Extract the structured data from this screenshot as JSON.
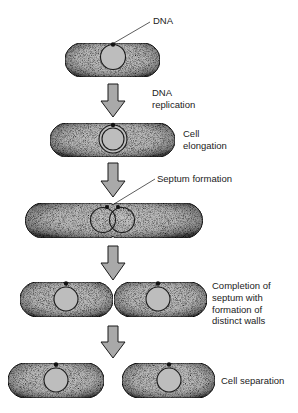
{
  "diagram": {
    "labels": {
      "dna": "DNA",
      "dna_replication_1": "DNA",
      "dna_replication_2": "replication",
      "cell_elongation_1": "Cell",
      "cell_elongation_2": "elongation",
      "septum_formation": "Septum formation",
      "completion_1": "Completion of",
      "completion_2": "septum with",
      "completion_3": "formation of",
      "completion_4": "distinct walls",
      "cell_separation": "Cell separation"
    },
    "stages": [
      {
        "name": "initial-cell",
        "caption": "DNA"
      },
      {
        "name": "dna-replication",
        "caption": "DNA replication"
      },
      {
        "name": "cell-elongation",
        "caption": "Cell elongation"
      },
      {
        "name": "septum-formation",
        "caption": "Septum formation"
      },
      {
        "name": "completion-of-septum",
        "caption": "Completion of septum with formation of distinct walls"
      },
      {
        "name": "cell-separation",
        "caption": "Cell separation"
      }
    ],
    "colors": {
      "cell_fill": "#b8b8b8",
      "cell_edge": "#4a4a4a",
      "outline": "#1a1a1a",
      "arrow_fill": "#a9a9a9",
      "text": "#222222"
    }
  }
}
